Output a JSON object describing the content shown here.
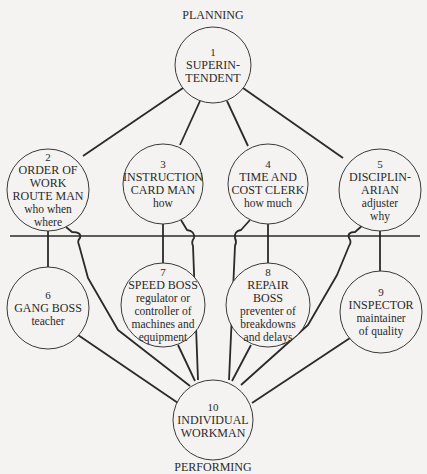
{
  "diagram": {
    "top_label": "PLANNING",
    "bottom_label": "PERFORMING",
    "colors": {
      "line": "#2a2a2a",
      "background": "#f4f3f1"
    },
    "nodes": [
      {
        "id": 1,
        "number": "1",
        "title": [
          "SUPERIN-",
          "TENDENT"
        ],
        "sub": []
      },
      {
        "id": 2,
        "number": "2",
        "title": [
          "ORDER OF",
          "WORK",
          "ROUTE MAN"
        ],
        "sub": [
          "who when",
          "where"
        ]
      },
      {
        "id": 3,
        "number": "3",
        "title": [
          "INSTRUCTION",
          "CARD MAN"
        ],
        "sub": [
          "how"
        ]
      },
      {
        "id": 4,
        "number": "4",
        "title": [
          "TIME AND",
          "COST CLERK"
        ],
        "sub": [
          "how much"
        ]
      },
      {
        "id": 5,
        "number": "5",
        "title": [
          "DISCIPLIN-",
          "ARIAN"
        ],
        "sub": [
          "adjuster",
          "why"
        ]
      },
      {
        "id": 6,
        "number": "6",
        "title": [
          "GANG BOSS"
        ],
        "sub": [
          "teacher"
        ]
      },
      {
        "id": 7,
        "number": "7",
        "title": [
          "SPEED BOSS"
        ],
        "sub": [
          "regulator or",
          "controller of",
          "machines and",
          "equipment"
        ]
      },
      {
        "id": 8,
        "number": "8",
        "title": [
          "REPAIR",
          "BOSS"
        ],
        "sub": [
          "preventer of",
          "breakdowns",
          "and delays"
        ]
      },
      {
        "id": 9,
        "number": "9",
        "title": [
          "INSPECTOR"
        ],
        "sub": [
          "maintainer",
          "of quality"
        ]
      },
      {
        "id": 10,
        "number": "10",
        "title": [
          "INDIVIDUAL",
          "WORKMAN"
        ],
        "sub": []
      }
    ],
    "edges": [
      [
        1,
        2
      ],
      [
        1,
        3
      ],
      [
        1,
        4
      ],
      [
        1,
        5
      ],
      [
        2,
        6
      ],
      [
        3,
        7
      ],
      [
        4,
        8
      ],
      [
        5,
        9
      ],
      [
        2,
        10
      ],
      [
        3,
        10
      ],
      [
        4,
        10
      ],
      [
        5,
        10
      ],
      [
        6,
        10
      ],
      [
        7,
        10
      ],
      [
        8,
        10
      ],
      [
        9,
        10
      ]
    ],
    "divider": "planning/performing separator line"
  }
}
